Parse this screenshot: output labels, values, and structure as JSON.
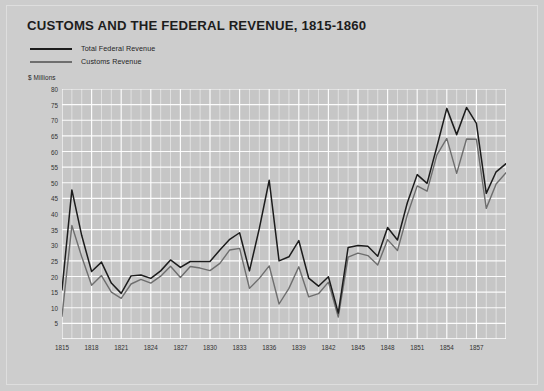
{
  "figure": {
    "title": "CUSTOMS AND THE FEDERAL REVENUE, 1815-1860",
    "units_label": "$ Millions"
  },
  "legend": {
    "items": [
      {
        "label": "Total Federal Revenue",
        "color": "#1c1c1c",
        "style": "thick"
      },
      {
        "label": "Customs Revenue",
        "color": "#6e6e6e",
        "style": "thin"
      }
    ]
  },
  "chart_data": {
    "type": "line",
    "title": "CUSTOMS AND THE FEDERAL REVENUE, 1815-1860",
    "xlabel": "",
    "ylabel": "$ Millions",
    "ylim": [
      0,
      80
    ],
    "xlim": [
      1815,
      1860
    ],
    "grid": true,
    "legend_position": "top-left",
    "yticks": [
      5,
      10,
      15,
      20,
      25,
      30,
      35,
      40,
      45,
      50,
      55,
      60,
      65,
      70,
      75,
      80
    ],
    "xticks": [
      1815,
      1818,
      1821,
      1824,
      1827,
      1830,
      1833,
      1836,
      1839,
      1842,
      1845,
      1848,
      1851,
      1854,
      1857
    ],
    "x": [
      1815,
      1816,
      1817,
      1818,
      1819,
      1820,
      1821,
      1822,
      1823,
      1824,
      1825,
      1826,
      1827,
      1828,
      1829,
      1830,
      1831,
      1832,
      1833,
      1834,
      1835,
      1836,
      1837,
      1838,
      1839,
      1840,
      1841,
      1842,
      1843,
      1844,
      1845,
      1846,
      1847,
      1848,
      1849,
      1850,
      1851,
      1852,
      1853,
      1854,
      1855,
      1856,
      1857,
      1858,
      1859,
      1860
    ],
    "series": [
      {
        "name": "Total Federal Revenue",
        "color": "#1c1c1c",
        "values": [
          15.7,
          47.7,
          33.1,
          21.6,
          24.6,
          17.9,
          14.6,
          20.2,
          20.5,
          19.4,
          21.8,
          25.3,
          22.9,
          24.8,
          24.8,
          24.8,
          28.5,
          31.9,
          34.0,
          21.8,
          35.4,
          50.8,
          25.0,
          26.3,
          31.5,
          19.5,
          16.9,
          19.9,
          8.3,
          29.3,
          29.9,
          29.7,
          26.5,
          35.7,
          31.7,
          43.6,
          52.6,
          49.8,
          61.6,
          73.8,
          65.4,
          74.1,
          69.0,
          46.6,
          53.5,
          56.1
        ]
      },
      {
        "name": "Customs Revenue",
        "color": "#6e6e6e",
        "values": [
          7.3,
          36.3,
          26.3,
          17.2,
          20.3,
          15.0,
          13.0,
          17.6,
          19.1,
          17.9,
          20.1,
          23.3,
          19.7,
          23.2,
          22.7,
          21.9,
          24.2,
          28.5,
          29.0,
          16.2,
          19.4,
          23.4,
          11.2,
          16.2,
          23.1,
          13.5,
          14.5,
          18.2,
          7.0,
          26.2,
          27.5,
          26.7,
          23.7,
          31.8,
          28.3,
          39.7,
          49.0,
          47.3,
          58.9,
          64.2,
          53.0,
          64.0,
          63.9,
          41.8,
          49.6,
          53.2
        ]
      }
    ]
  }
}
